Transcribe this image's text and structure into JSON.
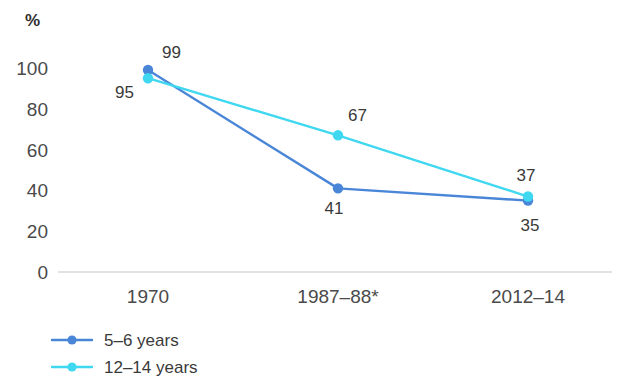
{
  "chart_data": {
    "type": "line",
    "title": "",
    "subtitle": "",
    "xlabel": "",
    "ylabel": "%",
    "ylim": [
      0,
      100
    ],
    "yticks": [
      "0",
      "20",
      "40",
      "60",
      "80",
      "100"
    ],
    "categories": [
      "1970",
      "1987–88*",
      "2012–14"
    ],
    "grid": false,
    "legend_position": "bottom-left",
    "series": [
      {
        "name": "5–6 years",
        "color": "#4a86d8",
        "values": [
          99,
          41,
          35
        ],
        "labels": [
          "99",
          "41",
          "35"
        ]
      },
      {
        "name": "12–14 years",
        "color": "#3fd8f0",
        "values": [
          95,
          67,
          37
        ],
        "labels": [
          "95",
          "67",
          "37"
        ]
      }
    ]
  },
  "axis": {
    "unit": "%",
    "baseline_color": "#d8d8d8"
  },
  "legend": {
    "items": [
      {
        "label": "5–6 years",
        "color": "#4a86d8"
      },
      {
        "label": "12–14 years",
        "color": "#3fd8f0"
      }
    ]
  }
}
